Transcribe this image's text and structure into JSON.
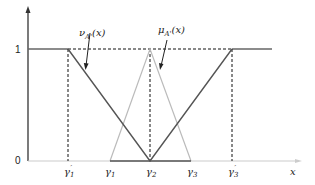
{
  "diagram": {
    "y_axis": {
      "ticks": [
        {
          "label": "0",
          "value": 0
        },
        {
          "label": "1",
          "value": 1
        }
      ]
    },
    "x_axis": {
      "label": "x"
    },
    "x_ticks": [
      {
        "label": "γ'1",
        "sym": "γ",
        "sub": "1",
        "prime": true
      },
      {
        "label": "γ1",
        "sym": "γ",
        "sub": "1",
        "prime": false
      },
      {
        "label": "γ2",
        "sym": "γ",
        "sub": "2",
        "prime": false
      },
      {
        "label": "γ3",
        "sym": "γ",
        "sub": "3",
        "prime": false
      },
      {
        "label": "γ'3",
        "sym": "γ",
        "sub": "3",
        "prime": true
      }
    ],
    "curves": {
      "nu": {
        "label": "ν_A'(x)",
        "sym": "ν",
        "sub": "A'",
        "arg": "(x)"
      },
      "mu": {
        "label": "μ_A'(x)",
        "sym": "μ",
        "sub": "A'",
        "arg": "(x)"
      }
    },
    "colors": {
      "dark": "#555555",
      "light": "#bbbbbb",
      "dashed": "#111111"
    }
  }
}
